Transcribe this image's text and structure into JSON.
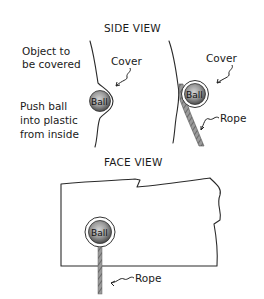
{
  "side_view": {
    "title": "SIDE VIEW",
    "left_panel": {
      "label_object_line1": "Object to",
      "label_object_line2": "be covered",
      "label_cover": "Cover",
      "label_push_line1": "Push ball",
      "label_push_line2": "into plastic",
      "label_push_line3": "from inside",
      "ball_label": "Ball"
    },
    "right_panel": {
      "label_cover": "Cover",
      "label_rope": "Rope",
      "ball_label": "Ball"
    }
  },
  "face_view": {
    "title": "FACE VIEW",
    "ball_label": "Ball",
    "label_rope": "Rope"
  },
  "colors": {
    "line": "#2a2a2a",
    "ball_light": "#bdbdbd",
    "ball_dark": "#4a4a4a",
    "background": "#ffffff"
  }
}
